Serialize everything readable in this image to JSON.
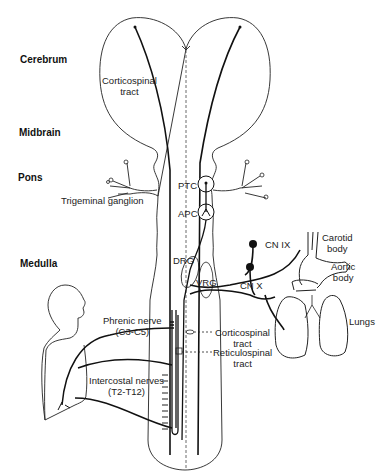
{
  "diagram": {
    "type": "neuroanatomy - respiratory control pathways",
    "regions": [
      {
        "id": "cerebrum",
        "label": "Cerebrum"
      },
      {
        "id": "midbrain",
        "label": "Midbrain"
      },
      {
        "id": "pons",
        "label": "Pons"
      },
      {
        "id": "medulla",
        "label": "Medulla"
      }
    ],
    "labels": {
      "corticospinal_upper": [
        "Corticospinal",
        "tract"
      ],
      "trigeminal": "Trigeminal ganglion",
      "ptc": "PTC",
      "apc": "APC",
      "drg": "DRG",
      "vrg": "VRG",
      "cn9": "CN IX",
      "cn10": "CN X",
      "carotid": [
        "Carotid",
        "body"
      ],
      "aortic": [
        "Aortic",
        "body"
      ],
      "lungs": "Lungs",
      "phrenic": [
        "Phrenic nerve",
        "(C3-C5)"
      ],
      "intercostal": [
        "Intercostal nerves",
        "(T2-T12)"
      ],
      "corticospinal_lower": [
        "Corticospinal",
        "tract"
      ],
      "reticulospinal": [
        "Reticulospinal",
        "tract"
      ]
    },
    "edges": [
      {
        "from": "cerebrum",
        "to": "spinal cord",
        "via": "Corticospinal tract"
      },
      {
        "from": "PTC",
        "to": "APC"
      },
      {
        "from": "APC",
        "to": "DRG"
      },
      {
        "from": "Carotid body",
        "to": "DRG",
        "via": "CN IX"
      },
      {
        "from": "Aortic body",
        "to": "DRG",
        "via": "CN X"
      },
      {
        "from": "Lungs",
        "to": "DRG",
        "via": "CN X"
      },
      {
        "from": "DRG/VRG",
        "to": "spinal cord",
        "via": "Reticulospinal tract"
      },
      {
        "from": "spinal cord",
        "to": "diaphragm",
        "via": "Phrenic nerve (C3-C5)"
      },
      {
        "from": "spinal cord",
        "to": "chest wall",
        "via": "Intercostal nerves (T2-T12)"
      }
    ]
  }
}
